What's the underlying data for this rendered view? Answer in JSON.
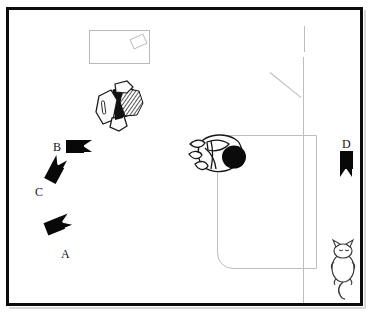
{
  "scene": {
    "title": "Top-down room layout with four camera positions",
    "background_color": "#ffffff",
    "frame_color": "#0c0c0c",
    "furniture_line_color": "#bdbdbd",
    "camera_color": "#080808"
  },
  "cameras": [
    {
      "id": "A",
      "label": "A",
      "label_x": 52,
      "label_y": 238,
      "icon_x": 36,
      "icon_y": 208,
      "rotation_deg": -22,
      "orientation": "pointing-up-right",
      "icon_name": "video-camera-icon"
    },
    {
      "id": "B",
      "label": "B",
      "label_x": 44,
      "label_y": 131,
      "icon_x": 57,
      "icon_y": 130,
      "rotation_deg": 0,
      "orientation": "pointing-right",
      "icon_name": "video-camera-icon"
    },
    {
      "id": "C",
      "label": "C",
      "label_x": 26,
      "label_y": 176,
      "icon_x": 34,
      "icon_y": 153,
      "rotation_deg": -62,
      "orientation": "pointing-up-right",
      "icon_name": "video-camera-icon"
    },
    {
      "id": "D",
      "label": "D",
      "label_x": 333,
      "label_y": 128,
      "icon_x": 331,
      "icon_y": 141,
      "rotation_deg": 0,
      "orientation": "pointing-down",
      "icon_name": "video-camera-icon"
    }
  ],
  "figures": [
    {
      "name": "seated-person-at-table",
      "description": "Top-down view of a person seated near the table, dark clothing with hatched shading",
      "x": 84,
      "y": 68,
      "width": 58,
      "height": 54
    },
    {
      "name": "lying-person-on-bed",
      "description": "Top-down view of a person lying on the bed with dark hair",
      "x": 176,
      "y": 116,
      "width": 66,
      "height": 56
    },
    {
      "name": "animal-outline",
      "description": "Top-down outline of a small animal with a long tail",
      "x": 318,
      "y": 228,
      "width": 34,
      "height": 62
    }
  ],
  "furniture": [
    {
      "name": "table-top",
      "description": "Rectangular table outline at top of the room",
      "x": 80,
      "y": 20,
      "width": 61,
      "height": 34
    },
    {
      "name": "paper-on-table",
      "description": "Small tilted sheet on the table",
      "x": 122,
      "y": 26,
      "width": 15,
      "height": 11,
      "rotation_deg": -24
    },
    {
      "name": "bed-outline",
      "description": "Bed with rounded lower-left corner",
      "x": 208,
      "y": 125,
      "width": 100,
      "height": 134
    }
  ],
  "walls": [
    {
      "name": "wall-segment-upper",
      "orientation": "vertical"
    },
    {
      "name": "wall-segment-main",
      "orientation": "vertical"
    },
    {
      "name": "wall-segment-diagonal",
      "orientation": "diagonal"
    }
  ]
}
